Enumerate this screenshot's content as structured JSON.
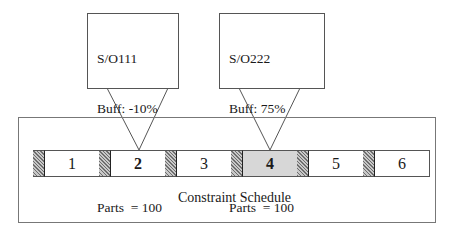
{
  "diagram": {
    "callouts": [
      {
        "id": "so111",
        "target_job": "2",
        "lines": [
          "S/O111",
          "Buff: -10%",
          "Tpp = 15 min",
          "Parts  = 100"
        ]
      },
      {
        "id": "so222",
        "target_job": "4",
        "lines": [
          "S/O222",
          "Buff: 75%",
          "Tpp = 20 min",
          "Parts  = 100"
        ]
      }
    ],
    "schedule": {
      "label": "Constraint Schedule",
      "jobs": [
        {
          "label": "1",
          "highlight": "none"
        },
        {
          "label": "2",
          "highlight": "bold"
        },
        {
          "label": "3",
          "highlight": "none"
        },
        {
          "label": "4",
          "highlight": "bold-shaded"
        },
        {
          "label": "5",
          "highlight": "none"
        },
        {
          "label": "6",
          "highlight": "none"
        }
      ],
      "buffer_marker": "hatched-setup-block"
    },
    "colors": {
      "line": "#555555",
      "hatch_dark": "#6e6e6e",
      "hatch_light": "#c8c8c8",
      "shaded_job": "#f3f3f3"
    }
  }
}
